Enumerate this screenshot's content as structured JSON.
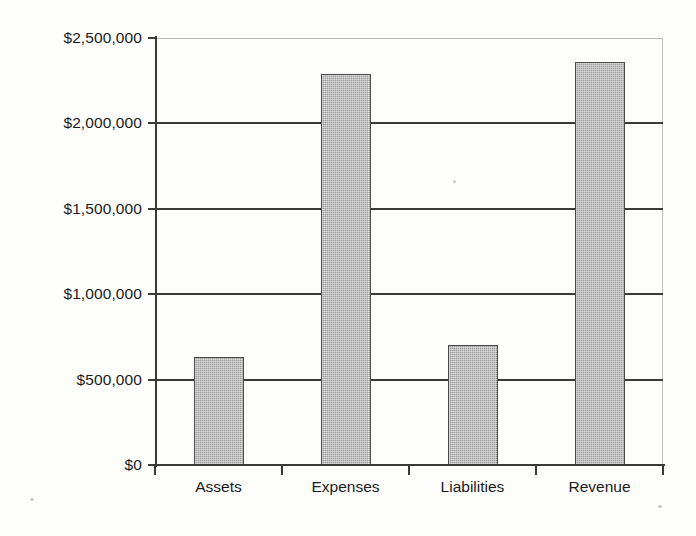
{
  "chart_data": {
    "type": "bar",
    "title": "",
    "subtitle": "",
    "xlabel": "",
    "ylabel": "",
    "categories": [
      "Assets",
      "Expenses",
      "Liabilities",
      "Revenue"
    ],
    "values": [
      630000,
      2290000,
      705000,
      2360000
    ],
    "value_labels": [
      "$630,000",
      "$2,290,000",
      "$705,000",
      "$2,360,000"
    ],
    "ylim": [
      0,
      2500000
    ],
    "ytick_values": [
      0,
      500000,
      1000000,
      1500000,
      2000000,
      2500000
    ],
    "ytick_labels": [
      "$0",
      "$500,000",
      "$1,000,000",
      "$1,500,000",
      "$2,000,000",
      "$2,500,000"
    ],
    "grid": true,
    "grid_axis": "y",
    "legend": false,
    "legend_position": "none",
    "annotations": [],
    "series": [
      {
        "name": "Amount",
        "values": [
          630000,
          2290000,
          705000,
          2360000
        ]
      }
    ]
  },
  "style": {
    "bar_fill": "#9b9b9b",
    "bar_border": "#4a4a4a",
    "axis_color": "#3a3a3a",
    "grid_color": "#3a3a3a",
    "frame_color": "#b9b9b9",
    "text_color": "#1b1b1b",
    "background": "#fdfdfc"
  }
}
